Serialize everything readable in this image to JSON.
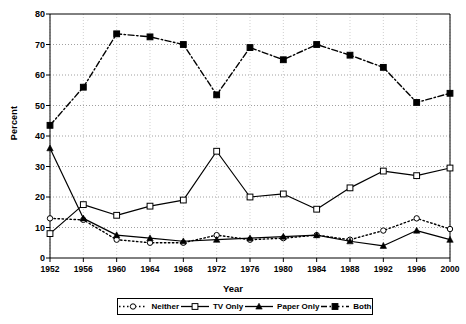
{
  "chart_data": {
    "type": "line",
    "title": "",
    "xlabel": "Year",
    "ylabel": "Percent",
    "xlim": [
      1952,
      2000
    ],
    "ylim": [
      0,
      80
    ],
    "ytick_step": 10,
    "grid": true,
    "legend_position": "bottom",
    "categories": [
      1952,
      1956,
      1960,
      1964,
      1968,
      1972,
      1976,
      1980,
      1984,
      1988,
      1992,
      1996,
      2000
    ],
    "xticklabels": [
      "1952",
      "1956",
      "1960",
      "1964",
      "1968",
      "1972",
      "1976",
      "1980",
      "1984",
      "1988",
      "1992",
      "1996",
      "2000"
    ],
    "yticklabels": [
      "0",
      "10",
      "20",
      "30",
      "40",
      "50",
      "60",
      "70",
      "80"
    ],
    "series": [
      {
        "name": "Neither",
        "marker": "open-circle",
        "linestyle": "dotted",
        "color": "#000000",
        "values": [
          13.0,
          12.5,
          6.0,
          5.0,
          5.0,
          7.5,
          6.0,
          6.5,
          7.5,
          6.0,
          9.0,
          13.0,
          9.5
        ]
      },
      {
        "name": "TV Only",
        "marker": "open-square",
        "linestyle": "solid",
        "color": "#000000",
        "values": [
          8.0,
          17.5,
          14.0,
          17.0,
          19.0,
          35.0,
          20.0,
          21.0,
          16.0,
          23.0,
          28.5,
          27.0,
          29.5
        ]
      },
      {
        "name": "Paper Only",
        "marker": "filled-triangle",
        "linestyle": "solid",
        "color": "#000000",
        "values": [
          36.0,
          13.0,
          7.5,
          6.5,
          5.5,
          6.0,
          6.5,
          7.0,
          7.5,
          5.5,
          4.0,
          9.0,
          6.0
        ]
      },
      {
        "name": "Both",
        "marker": "filled-square",
        "linestyle": "dashdot",
        "color": "#000000",
        "values": [
          43.5,
          56.0,
          73.5,
          72.5,
          70.0,
          53.5,
          69.0,
          65.0,
          70.0,
          66.5,
          62.5,
          51.0,
          54.0
        ]
      }
    ]
  }
}
